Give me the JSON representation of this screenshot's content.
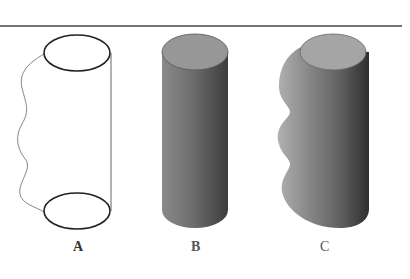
{
  "figure": {
    "rule_color": "#444444",
    "panels": [
      {
        "id": "A",
        "label": "A",
        "description": "Wireframe cylinder with wavy left profile"
      },
      {
        "id": "B",
        "label": "B",
        "description": "Shaded straight cylinder"
      },
      {
        "id": "C",
        "label": "C",
        "description": "Shaded cylinder with wavy bulging left side"
      }
    ]
  }
}
